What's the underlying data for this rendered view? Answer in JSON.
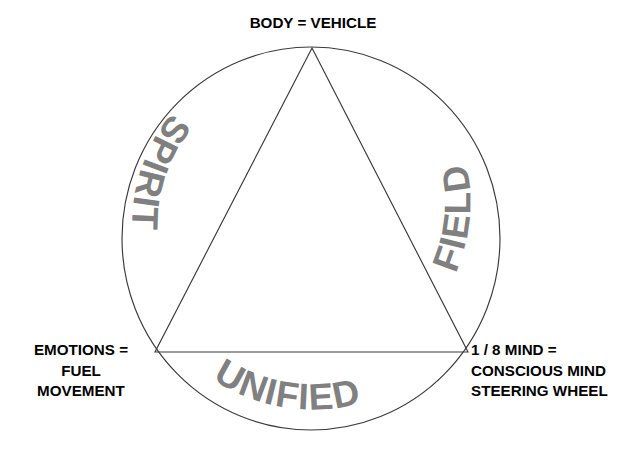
{
  "diagram": {
    "background_color": "#ffffff",
    "stroke_color": "#3a3a3a",
    "arc_text_color": "#808080",
    "label_text_color": "#000000",
    "shapes": [
      {
        "name": "outer-circle",
        "type": "ellipse",
        "cx": 311,
        "cy": 238.5,
        "rx": 189,
        "ry": 191.5
      },
      {
        "name": "inscribed-triangle",
        "type": "polygon",
        "points": "312,48 155,352 468,352"
      }
    ],
    "arc_labels": {
      "left": "SPIRIT",
      "right": "FIELD",
      "bottom": "UNIFIED"
    },
    "corner_labels": {
      "top": {
        "name": "body-vehicle",
        "lines": [
          "BODY = VEHICLE"
        ]
      },
      "bottom_left": {
        "name": "emotions-fuel-movement",
        "line1": "EMOTIONS =",
        "line2": "FUEL",
        "line3": "MOVEMENT"
      },
      "bottom_right": {
        "name": "mind-steering-wheel",
        "line1": "1 / 8 MIND =",
        "line2": "CONSCIOUS MIND",
        "line3": "STEERING WHEEL"
      }
    }
  }
}
